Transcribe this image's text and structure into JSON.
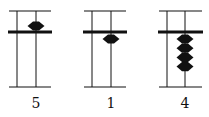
{
  "figure": {
    "ink_color": "#111111",
    "abaci": [
      {
        "label": "5",
        "upper_beads_down": 1,
        "lower_beads_up": 0
      },
      {
        "label": "1",
        "upper_beads_down": 0,
        "lower_beads_up": 1
      },
      {
        "label": "4",
        "upper_beads_down": 0,
        "lower_beads_up": 4
      }
    ]
  }
}
